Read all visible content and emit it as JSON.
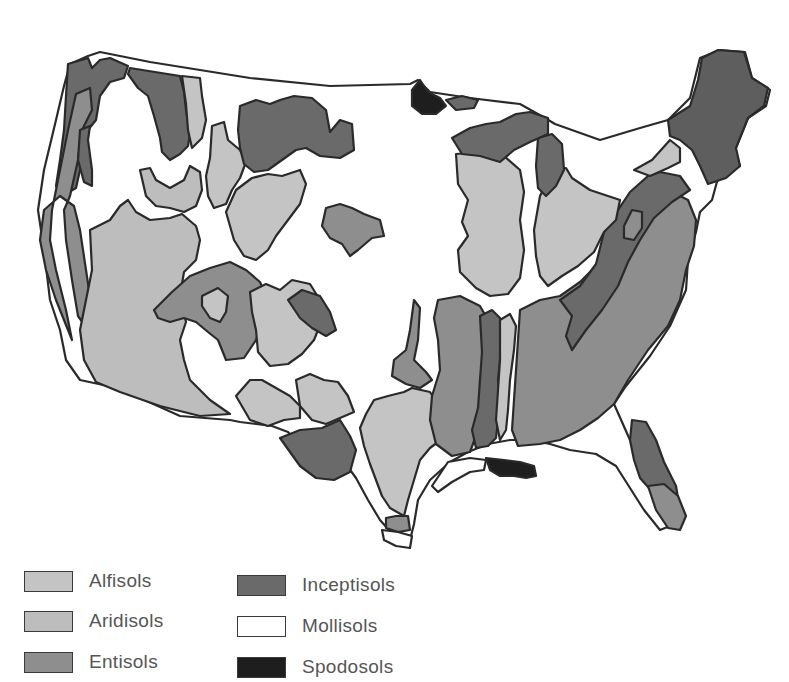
{
  "map": {
    "subject": "Soil orders of the contiguous United States",
    "colors": {
      "alfisols": "#c4c4c4",
      "aridisols": "#bdbdbd",
      "entisols": "#8e8e8e",
      "inceptisols": "#6a6a6a",
      "mollisols": "#ffffff",
      "spodosols": "#1e1e1e",
      "outline": "#2a2a2a"
    }
  },
  "legend": {
    "items": [
      {
        "key": "alfisols",
        "label": "Alfisols",
        "color": "#c4c4c4"
      },
      {
        "key": "aridisols",
        "label": "Aridisols",
        "color": "#bdbdbd"
      },
      {
        "key": "entisols",
        "label": "Entisols",
        "color": "#8e8e8e"
      },
      {
        "key": "inceptisols",
        "label": "Inceptisols",
        "color": "#6a6a6a"
      },
      {
        "key": "mollisols",
        "label": "Mollisols",
        "color": "#ffffff"
      },
      {
        "key": "spodosols",
        "label": "Spodosols",
        "color": "#1e1e1e"
      }
    ]
  }
}
